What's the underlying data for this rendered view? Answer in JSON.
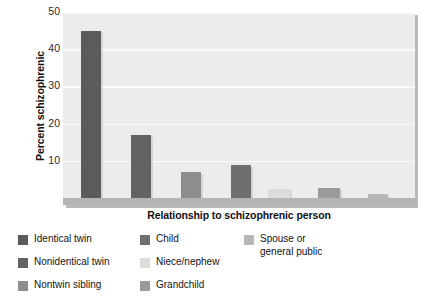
{
  "chart_data": {
    "type": "bar",
    "title": "",
    "xlabel": "Relationship to schizophrenic person",
    "ylabel": "Percent schizophrenic",
    "ylim": [
      0,
      50
    ],
    "yticks": [
      10,
      20,
      30,
      40,
      50
    ],
    "grid": true,
    "legend_position": "bottom",
    "categories": [
      "Identical twin",
      "Nonidentical twin",
      "Nontwin sibling",
      "Child",
      "Niece/nephew",
      "Grandchild",
      "Spouse or general public"
    ],
    "values": [
      45,
      17,
      7,
      9,
      2.5,
      2.8,
      1
    ],
    "colors": [
      "#5b5b5b",
      "#636363",
      "#8d8d8d",
      "#6f6f6f",
      "#dcdcda",
      "#9a9a9a",
      "#b8b8b6"
    ],
    "bar_pixel_layout": [
      {
        "left": 18,
        "width": 20
      },
      {
        "left": 68,
        "width": 20
      },
      {
        "left": 118,
        "width": 20
      },
      {
        "left": 168,
        "width": 20
      },
      {
        "left": 205,
        "width": 22
      },
      {
        "left": 255,
        "width": 22
      },
      {
        "left": 305,
        "width": 20
      }
    ]
  },
  "axes": {
    "y_title": "Percent schizophrenic",
    "x_title": "Relationship to schizophrenic person",
    "y_tick_labels": [
      "50",
      "40",
      "30",
      "20",
      "10"
    ]
  },
  "legend": {
    "columns": [
      {
        "items": [
          {
            "label": "Identical twin",
            "color": "#5b5b5b"
          },
          {
            "label": "Nonidentical twin",
            "color": "#636363"
          },
          {
            "label": "Nontwin sibling",
            "color": "#8d8d8d"
          }
        ]
      },
      {
        "items": [
          {
            "label": "Child",
            "color": "#6f6f6f"
          },
          {
            "label": "Niece/nephew",
            "color": "#dcdcda"
          },
          {
            "label": "Grandchild",
            "color": "#9a9a9a"
          }
        ]
      },
      {
        "items": [
          {
            "label": "Spouse or\ngeneral public",
            "color": "#b8b8b6"
          }
        ]
      }
    ]
  },
  "style": {
    "plot_background": "#ececeb",
    "gridline_color": "#fafafa",
    "floor_color": "#b4b4b2",
    "text_color": "#141414"
  }
}
